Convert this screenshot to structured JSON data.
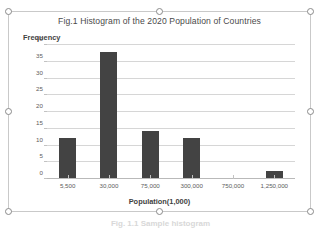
{
  "chart_object": {
    "selected": true,
    "handle_names": [
      "top-left",
      "top-center",
      "top-right",
      "middle-left",
      "middle-right",
      "bottom-left",
      "bottom-center",
      "bottom-right"
    ]
  },
  "page": {
    "caption_clipped": "Fig. 1.1  Sample histogram"
  },
  "colors": {
    "bar": "#434343",
    "gridline": "#d6d6d6",
    "axis": "#b9b9b9",
    "title_text": "#4a4a4a",
    "tick_text": "#5c5c5c",
    "frame": "#c9c9c9",
    "handle_fill": "#ffffff",
    "handle_stroke": "#8a8a8a"
  },
  "chart_data": {
    "type": "bar",
    "title": "Fig.1 Histogram of the 2020 Population of Countries",
    "xlabel": "Population(1,000)",
    "ylabel": "Frequency",
    "categories": [
      "5,500",
      "30,000",
      "75,000",
      "300,000",
      "750,000",
      "1,250,000"
    ],
    "values": [
      12,
      38,
      14,
      12,
      0,
      2
    ],
    "ylim": [
      0,
      40
    ],
    "yticks": [
      0,
      5,
      10,
      15,
      20,
      25,
      30,
      35,
      40
    ],
    "ytick_labels": [
      "0",
      "5",
      "10",
      "15",
      "20",
      "25",
      "30",
      "35",
      "40"
    ],
    "grid": true,
    "grid_axis": "y",
    "legend": false,
    "bar_color": "#434343"
  }
}
